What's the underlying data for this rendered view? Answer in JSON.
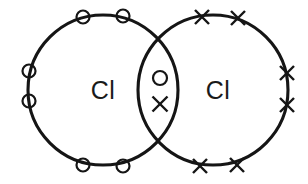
{
  "diagram": {
    "type": "lewis-dot-and-cross",
    "molecule": "Cl2",
    "canvas": {
      "width": 308,
      "height": 184,
      "background": "#ffffff"
    },
    "stroke_color": "#151515",
    "atoms": [
      {
        "id": "left-atom",
        "label": "Cl",
        "label_x": 103,
        "label_y": 92,
        "ring": {
          "cx": 103,
          "cy": 90,
          "r": 75
        },
        "electron_symbol": "circle"
      },
      {
        "id": "right-atom",
        "label": "Cl",
        "label_x": 218,
        "label_y": 92,
        "ring": {
          "cx": 213,
          "cy": 90,
          "r": 75
        },
        "electron_symbol": "cross"
      }
    ],
    "lone_pair_circles": [
      {
        "cx": 83,
        "cy": 17,
        "r": 6.5
      },
      {
        "cx": 123,
        "cy": 16,
        "r": 6.5
      },
      {
        "cx": 29,
        "cy": 71,
        "r": 6.5
      },
      {
        "cx": 29,
        "cy": 101,
        "r": 6.5
      },
      {
        "cx": 83,
        "cy": 165,
        "r": 6.5
      },
      {
        "cx": 123,
        "cy": 166,
        "r": 6.5
      }
    ],
    "lone_pair_crosses": [
      {
        "cx": 202,
        "cy": 17,
        "s": 7
      },
      {
        "cx": 238,
        "cy": 18,
        "s": 7
      },
      {
        "cx": 287,
        "cy": 73,
        "s": 7
      },
      {
        "cx": 287,
        "cy": 105,
        "s": 7
      },
      {
        "cx": 200,
        "cy": 166,
        "s": 7
      },
      {
        "cx": 237,
        "cy": 165,
        "s": 7
      }
    ],
    "shared_pair": {
      "dot": {
        "cx": 160,
        "cy": 78,
        "r": 7
      },
      "cross": {
        "cx": 160,
        "cy": 104,
        "s": 7.5
      }
    }
  }
}
